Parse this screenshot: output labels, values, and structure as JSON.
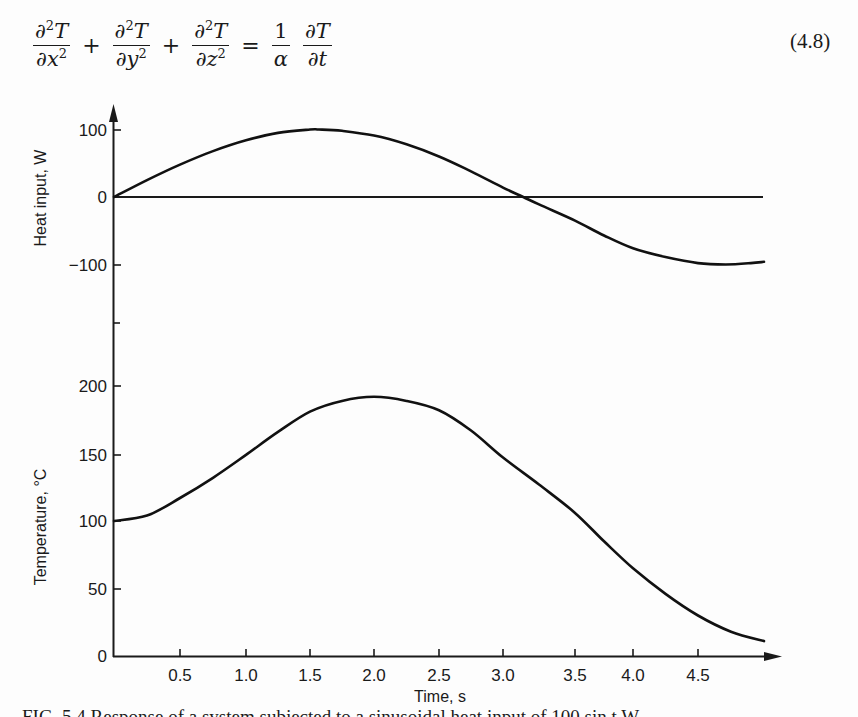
{
  "equation": {
    "terms": [
      {
        "num_prefix": "∂",
        "num_sup": "2",
        "num_var": "T",
        "den_prefix": "∂",
        "den_var": "x",
        "den_sup": "2"
      },
      {
        "num_prefix": "∂",
        "num_sup": "2",
        "num_var": "T",
        "den_prefix": "∂",
        "den_var": "y",
        "den_sup": "2"
      },
      {
        "num_prefix": "∂",
        "num_sup": "2",
        "num_var": "T",
        "den_prefix": "∂",
        "den_var": "z",
        "den_sup": "2"
      }
    ],
    "plus": "+",
    "equals": "=",
    "rhs_coef": {
      "num": "1",
      "den": "α"
    },
    "rhs_deriv": {
      "num": "∂T",
      "den": "∂t"
    },
    "number": "(4.8)"
  },
  "chart_data": [
    {
      "type": "line",
      "title": "",
      "xlabel": "Time, s",
      "ylabel": "Heat input, W",
      "x_ticks": [
        "0.5",
        "1.0",
        "1.5",
        "2.0",
        "2.5",
        "3.0",
        "3.5",
        "4.0",
        "4.5"
      ],
      "y_ticks": [
        "100",
        "0",
        "−100"
      ],
      "ylim": [
        -100,
        100
      ],
      "xlim": [
        0,
        5.0
      ],
      "grid": false,
      "series": [
        {
          "name": "Heat input",
          "x": [
            0,
            0.25,
            0.5,
            0.75,
            1.0,
            1.25,
            1.5,
            1.57,
            1.75,
            2.0,
            2.25,
            2.5,
            2.75,
            3.0,
            3.14,
            3.25,
            3.5,
            3.75,
            4.0,
            4.25,
            4.5,
            4.71,
            4.9,
            5.0
          ],
          "values": [
            0,
            25,
            48,
            68,
            84,
            95,
            100,
            100,
            98,
            91,
            78,
            60,
            38,
            14,
            0,
            -11,
            -35,
            -57,
            -76,
            -89,
            -98,
            -100,
            -98,
            -96
          ]
        },
        {
          "name": "Zero reference line",
          "x": [
            0,
            5.0
          ],
          "values": [
            0,
            0
          ]
        }
      ]
    },
    {
      "type": "line",
      "title": "",
      "xlabel": "Time, s",
      "ylabel": "Temperature, °C",
      "x_ticks": [
        "0.5",
        "1.0",
        "1.5",
        "2.0",
        "2.5",
        "3.0",
        "3.5",
        "4.0",
        "4.5"
      ],
      "y_ticks": [
        "200",
        "150",
        "100",
        "50",
        "0"
      ],
      "ylim": [
        0,
        200
      ],
      "xlim": [
        0,
        5.0
      ],
      "grid": false,
      "series": [
        {
          "name": "Temperature",
          "x": [
            0,
            0.25,
            0.5,
            0.75,
            1.0,
            1.25,
            1.5,
            1.75,
            2.0,
            2.25,
            2.5,
            2.75,
            3.0,
            3.25,
            3.5,
            3.75,
            4.0,
            4.25,
            4.5,
            4.75,
            5.0
          ],
          "values": [
            100,
            104,
            117,
            132,
            149,
            166,
            181,
            189,
            192,
            189,
            182,
            167,
            147,
            127,
            106,
            85,
            65,
            46,
            30,
            18,
            11
          ]
        }
      ]
    }
  ],
  "axes": {
    "x_label": "Time, s",
    "y_label_top": "Heat input, W",
    "y_label_bottom": "Temperature, °C",
    "x_ticks": [
      {
        "label": "0.5",
        "px": 180
      },
      {
        "label": "1.0",
        "px": 246
      },
      {
        "label": "1.5",
        "px": 310
      },
      {
        "label": "2.0",
        "px": 374
      },
      {
        "label": "2.5",
        "px": 439
      },
      {
        "label": "3.0",
        "px": 503
      },
      {
        "label": "3.5",
        "px": 575
      },
      {
        "label": "4.0",
        "px": 633
      },
      {
        "label": "4.5",
        "px": 698
      }
    ],
    "y_ticks_top": [
      {
        "label": "100",
        "py": 130
      },
      {
        "label": "0",
        "py": 197
      },
      {
        "label": "−100",
        "py": 265
      }
    ],
    "y_ticks_bottom": [
      {
        "label": "200",
        "py": 386
      },
      {
        "label": "150",
        "py": 455
      },
      {
        "label": "100",
        "py": 521
      },
      {
        "label": "50",
        "py": 589
      },
      {
        "label": "0",
        "py": 656
      }
    ]
  },
  "caption": "FIG. 5.4 Response of a system subjected to a sinusoidal heat input of 100 sin t W"
}
